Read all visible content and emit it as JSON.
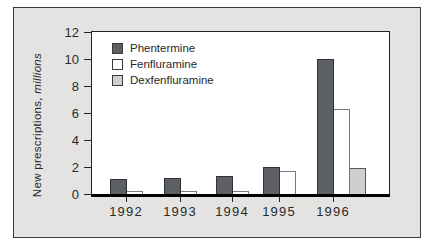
{
  "figure": {
    "panel_bg": "#e4e3e1",
    "panel_border": "#3a3a3a",
    "text_color": "#2a2a2a"
  },
  "chart_data": {
    "type": "bar",
    "title": "",
    "ylabel": "New prescriptions, millions",
    "ylabel_main": "New prescriptions,",
    "ylabel_italic": "millions",
    "xlabel": "",
    "categories": [
      "1992",
      "1993",
      "1994",
      "1995",
      "1996"
    ],
    "series": [
      {
        "name": "Phentermine",
        "values": [
          1.1,
          1.2,
          1.3,
          2.0,
          10.0
        ],
        "fill": "#5c5f64",
        "border": "#2f3235"
      },
      {
        "name": "Fenfluramine",
        "values": [
          0.2,
          0.2,
          0.2,
          1.7,
          6.3
        ],
        "fill": "#ffffff",
        "border": "#77787a"
      },
      {
        "name": "Dexfenfluramine",
        "values": [
          0,
          0,
          0,
          0,
          1.9
        ],
        "fill": "#d0cfcd",
        "border": "#59595b"
      }
    ],
    "yticks": [
      0,
      2,
      4,
      6,
      8,
      10,
      12
    ],
    "ylim": [
      0,
      12
    ],
    "grid": false,
    "legend_position": "top-left-inside"
  }
}
